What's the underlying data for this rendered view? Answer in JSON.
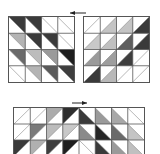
{
  "figure": {
    "panels": [
      {
        "id": "top-left",
        "rows": 4,
        "cols": 4,
        "x": 8,
        "y": 16,
        "w": 67,
        "h": 67,
        "diagonal": "tl-br",
        "shaded_half": "upper-right",
        "cells": [
          [
            "#3a3a3a",
            "#3a3a3a",
            "#ffffff",
            "#ffffff"
          ],
          [
            "#b4b4b4",
            "#3a3a3a",
            "#3a3a3a",
            "#ffffff"
          ],
          [
            "#6a6a6a",
            "#bcbcbc",
            "#9a9a9a",
            "#1e1e1e"
          ],
          [
            "#ffffff",
            "#b4b4b4",
            "#5a5a5a",
            "#3e3e3e"
          ]
        ]
      },
      {
        "id": "top-right",
        "rows": 4,
        "cols": 4,
        "x": 83,
        "y": 16,
        "w": 67,
        "h": 67,
        "diagonal": "bl-tr",
        "shaded_half": "lower-right",
        "cells": [
          [
            "#ffffff",
            "#c4c4c4",
            "#c4c4c4",
            "#3a3a3a"
          ],
          [
            "#c8c8c8",
            "#c0c0c0",
            "#5e5e5e",
            "#3a3a3a"
          ],
          [
            "#9a9a9a",
            "#9e9e9e",
            "#3e3e3e",
            "#ffffff"
          ],
          [
            "#3a3a3a",
            "#b8b8b8",
            "#ffffff",
            "#ffffff"
          ]
        ]
      },
      {
        "id": "bottom",
        "rows": 3,
        "cols": 8,
        "x": 13,
        "y": 107,
        "w": 132,
        "h": 50,
        "halves": [
          {
            "cols": [
              0,
              1,
              2,
              3
            ],
            "diagonal": "bl-tr",
            "shaded_half": "upper-left",
            "cells": [
              [
                "#ffffff",
                "#ffffff",
                "#acacac",
                "#2e2e2e"
              ],
              [
                "#ffffff",
                "#7a7a7a",
                "#bcbcbc",
                "#c8c8c8"
              ],
              [
                "#3a3a3a",
                "#b0b0b0",
                "#3e3e3e",
                "#1e1e1e"
              ]
            ]
          },
          {
            "cols": [
              4,
              5,
              6,
              7
            ],
            "diagonal": "tl-br",
            "shaded_half": "lower-left",
            "cells": [
              [
                "#3a3a3a",
                "#9a9a9a",
                "#a8a8a8",
                "#ffffff"
              ],
              [
                "#8a8a8a",
                "#262626",
                "#6a6a6a",
                "#c4c4c4"
              ],
              [
                "#ffffff",
                "#3a3a3a",
                "#9a9a9a",
                "#c0c0c0"
              ]
            ]
          }
        ]
      }
    ],
    "arrows": [
      {
        "id": "top-arrow",
        "direction": "left",
        "x1": 86,
        "x2": 70,
        "y": 13
      },
      {
        "id": "bottom-arrow",
        "direction": "right",
        "x1": 72,
        "x2": 87,
        "y": 103
      }
    ],
    "grid_line_color": "#555555"
  }
}
